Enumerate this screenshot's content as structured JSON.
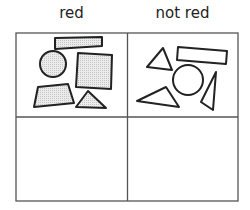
{
  "headers": {
    "left": "red",
    "right": "not red"
  },
  "grid": {
    "rows": 2,
    "cols": 2,
    "cells": [
      {
        "row": 0,
        "col": 0,
        "label": "red",
        "shapes": [
          "rectangle",
          "circle",
          "square",
          "trapezoid",
          "triangle"
        ],
        "fill": "gray-dotted"
      },
      {
        "row": 0,
        "col": 1,
        "label": "not red",
        "shapes": [
          "triangle",
          "rectangle",
          "circle",
          "triangle",
          "triangle"
        ],
        "fill": "none"
      },
      {
        "row": 1,
        "col": 0,
        "shapes": []
      },
      {
        "row": 1,
        "col": 1,
        "shapes": []
      }
    ]
  },
  "colors": {
    "line": "#222222",
    "grid": "#555555",
    "fill": "#e0e0e0"
  }
}
